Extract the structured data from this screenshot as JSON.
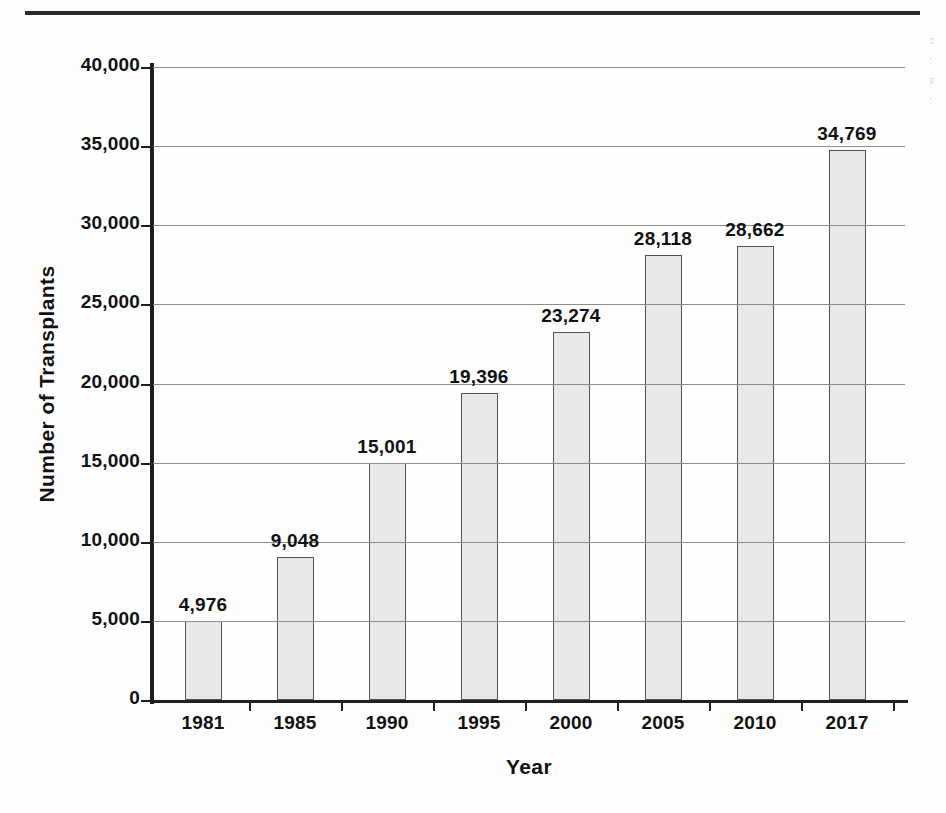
{
  "figure": {
    "margin_note_fragments": [
      "c",
      "t",
      "s",
      "t"
    ]
  },
  "chart_data": {
    "type": "bar",
    "title": "",
    "xlabel": "Year",
    "ylabel": "Number of Transplants",
    "categories": [
      "1981",
      "1985",
      "1990",
      "1995",
      "2000",
      "2005",
      "2010",
      "2017"
    ],
    "values": [
      4976,
      9048,
      15001,
      19396,
      23274,
      28118,
      28662,
      34769
    ],
    "value_labels": [
      "4,976",
      "9,048",
      "15,001",
      "19,396",
      "23,274",
      "28,118",
      "28,662",
      "34,769"
    ],
    "ylim": [
      0,
      40000
    ],
    "ytick_values": [
      0,
      5000,
      10000,
      15000,
      20000,
      25000,
      30000,
      35000,
      40000
    ],
    "ytick_labels": [
      "0",
      "5,000",
      "10,000",
      "15,000",
      "20,000",
      "25,000",
      "30,000",
      "35,000",
      "40,000"
    ],
    "grid": true,
    "grid_axis": "y",
    "legend": false,
    "bar_fill_color": "#e8e8e8",
    "bar_border_color": "#555555",
    "gridline_color": "#8d8d8d",
    "axis_color": "#1f1f1f",
    "text_color": "#111111"
  }
}
